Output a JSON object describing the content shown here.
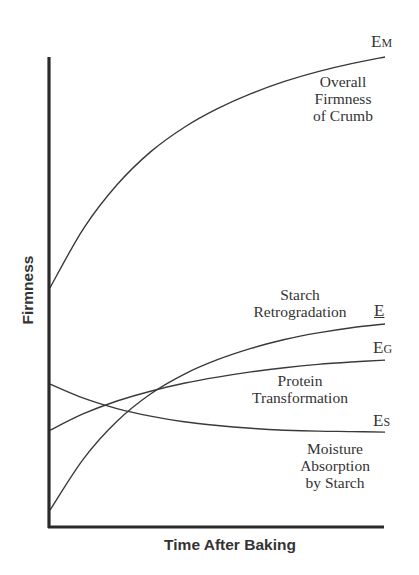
{
  "chart_data": {
    "type": "line",
    "title": "",
    "xlabel": "Time After Baking",
    "ylabel": "Firmness",
    "xlim": [
      0,
      10
    ],
    "ylim": [
      0,
      100
    ],
    "grid": false,
    "legend": "inline labels at curve ends",
    "x": [
      0,
      1,
      2,
      3,
      4,
      5,
      6,
      7,
      8,
      9,
      10
    ],
    "series": [
      {
        "name": "Overall Firmness of Crumb",
        "end_label": "E",
        "end_label_sub": "M",
        "values": [
          50.9,
          63.5,
          72.8,
          79.8,
          85.0,
          89.0,
          92.2,
          94.8,
          96.9,
          98.6,
          100.0
        ]
      },
      {
        "name": "Starch Retrogradation",
        "end_label": "E",
        "end_label_sub": "",
        "values": [
          3.6,
          14.5,
          22.5,
          28.3,
          32.5,
          35.6,
          38.0,
          39.9,
          41.3,
          42.4,
          43.2
        ]
      },
      {
        "name": "Protein Transformation",
        "end_label": "E",
        "end_label_sub": "G",
        "values": [
          20.6,
          24.1,
          26.8,
          28.9,
          30.6,
          31.9,
          33.0,
          33.9,
          34.6,
          35.1,
          35.5
        ]
      },
      {
        "name": "Moisture Absorption by Starch",
        "end_label": "E",
        "end_label_sub": "S",
        "values": [
          30.4,
          27.4,
          25.2,
          23.6,
          22.4,
          21.6,
          21.0,
          20.6,
          20.4,
          20.3,
          20.2
        ]
      }
    ],
    "annotations": [
      {
        "text": [
          "Overall",
          "Firmness",
          "of Crumb"
        ],
        "near": "E_M"
      },
      {
        "text": [
          "Starch",
          "Retrogradation"
        ],
        "near": "E"
      },
      {
        "text": [
          "Protein",
          "Transformation"
        ],
        "near": "E_G"
      },
      {
        "text": [
          "Moisture",
          "Absorption",
          "by Starch"
        ],
        "near": "E_S"
      }
    ]
  },
  "labels": {
    "ylabel": "Firmness",
    "xlabel": "Time After Baking",
    "em": {
      "main": "E",
      "sub": "M"
    },
    "e": {
      "main": "E"
    },
    "eg": {
      "main": "E",
      "sub": "G"
    },
    "es": {
      "main": "E",
      "sub": "S"
    },
    "overall": [
      "Overall",
      "Firmness",
      "of Crumb"
    ],
    "starch_retro": [
      "Starch",
      "Retrogradation"
    ],
    "protein": [
      "Protein",
      "Transformation"
    ],
    "moisture": [
      "Moisture",
      "Absorption",
      "by Starch"
    ]
  },
  "colors": {
    "ink": "#333333",
    "background": "#ffffff"
  }
}
